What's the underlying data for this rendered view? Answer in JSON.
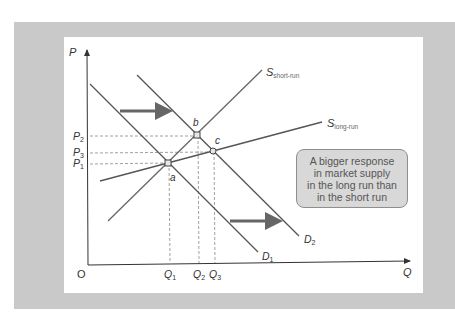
{
  "diagram": {
    "type": "supply-demand",
    "colors": {
      "frame": "#c9c9c9",
      "panel": "#ffffff",
      "curve": "#555555",
      "arrow": "#666666",
      "point_fill": "#e6e6e6",
      "callout_bg": "#d8d8d8"
    },
    "axes": {
      "y_label": "P",
      "x_label": "Q",
      "origin_label": "O"
    },
    "price_levels": [
      {
        "main": "P",
        "sub": "2"
      },
      {
        "main": "P",
        "sub": "3"
      },
      {
        "main": "P",
        "sub": "1"
      }
    ],
    "quantity_levels": [
      {
        "main": "Q",
        "sub": "1"
      },
      {
        "main": "Q",
        "sub": "2"
      },
      {
        "main": "Q",
        "sub": "3"
      }
    ],
    "curves": {
      "s_short": {
        "main": "S",
        "sub": "short-run"
      },
      "s_long": {
        "main": "S",
        "sub": "long-run"
      },
      "d1": {
        "main": "D",
        "sub": "1"
      },
      "d2": {
        "main": "D",
        "sub": "2"
      }
    },
    "points": {
      "a": "a",
      "b": "b",
      "c": "c"
    },
    "callout": {
      "lines": [
        "A bigger response",
        "in market supply",
        "in the long run than",
        "in the short run"
      ]
    }
  }
}
